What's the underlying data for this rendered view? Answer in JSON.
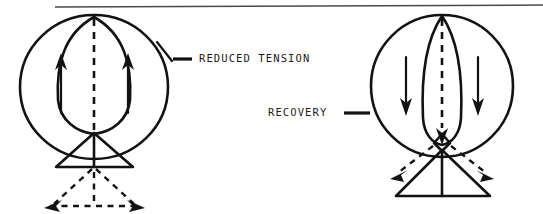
{
  "figure": {
    "title": "Reduced tension and recovery diagram",
    "background_color": "#ffffff",
    "ink_color": "#121212",
    "rule_color": "#4a4a4a",
    "top_rule": {
      "name": "page-top-rule",
      "x1": 55,
      "y1": 7,
      "x2": 543,
      "y2": 5
    },
    "labels": [
      {
        "id": "reduced-tension",
        "text": "REDUCED TENSION",
        "x": 196,
        "y": 59,
        "leader": {
          "x1": 171,
          "y1": 59,
          "x2": 191,
          "y2": 59
        },
        "pointer": {
          "x1": 158,
          "y1": 44,
          "x2": 172,
          "y2": 60
        }
      },
      {
        "id": "recovery",
        "text": "RECOVERY",
        "x": 268,
        "y": 113,
        "leader": {
          "x1": 344,
          "y1": 113,
          "x2": 366,
          "y2": 113
        }
      }
    ],
    "panels": [
      {
        "id": "panel-reduced-tension",
        "name": "reduced-tension-panel",
        "caption_ref": "reduced-tension",
        "balloon": {
          "cx": 94,
          "cy": 87,
          "rx": 74,
          "ry": 72
        },
        "inner_lens": {
          "cx": 94,
          "cy": 76,
          "rx": 36,
          "ry": 60,
          "shape": "wide-lens"
        },
        "center_dashed_line": {
          "x": 94,
          "y1": 18,
          "y2": 134
        },
        "flow_arrows": [
          {
            "id": "left-up-arrow",
            "x": 61,
            "y1": 112,
            "y2": 58,
            "direction": "up"
          },
          {
            "id": "right-up-arrow",
            "x": 128,
            "y1": 112,
            "y2": 58,
            "direction": "up"
          }
        ],
        "solid_triangle": {
          "apex_x": 94,
          "apex_y": 133,
          "left_x": 56,
          "right_x": 133,
          "base_y": 167
        },
        "triangle_center_post": {
          "x": 94,
          "y1": 133,
          "y2": 167
        },
        "dashed_triangle": {
          "apex_x": 94,
          "apex_y": 167,
          "left_x": 45,
          "right_x": 145,
          "base_y": 206,
          "arrowheads": [
            "bottom-left",
            "bottom-right"
          ]
        },
        "dashed_center_post": {
          "x": 94,
          "y1": 169,
          "y2": 206
        }
      },
      {
        "id": "panel-recovery",
        "name": "recovery-panel",
        "caption_ref": "recovery",
        "balloon": {
          "cx": 442,
          "cy": 86,
          "rx": 71,
          "ry": 71
        },
        "inner_lens": {
          "cx": 442,
          "cy": 80,
          "rx": 22,
          "ry": 65,
          "shape": "narrow-lens"
        },
        "center_dashed_line": {
          "x": 442,
          "y1": 18,
          "y2": 140
        },
        "flow_arrows": [
          {
            "id": "left-down-arrow",
            "x": 406,
            "y1": 57,
            "y2": 113,
            "direction": "down"
          },
          {
            "id": "right-down-arrow",
            "x": 478,
            "y1": 57,
            "y2": 113,
            "direction": "down"
          }
        ],
        "center_node": {
          "cx": 442,
          "cy": 142,
          "r": 7,
          "shape": "diamond"
        },
        "node_arrow": {
          "x": 442,
          "y1": 128,
          "y2": 143,
          "direction": "down"
        },
        "solid_triangle": {
          "apex_x": 442,
          "apex_y": 150,
          "left_x": 396,
          "right_x": 490,
          "base_y": 196
        },
        "triangle_center_post": {
          "x": 442,
          "y1": 150,
          "y2": 196
        },
        "dashed_recoil_arrows": [
          {
            "id": "left-recoil-arrow",
            "x1": 434,
            "y1": 146,
            "x2": 394,
            "y2": 178,
            "direction": "down-left"
          },
          {
            "id": "right-recoil-arrow",
            "x1": 450,
            "y1": 146,
            "x2": 490,
            "y2": 178,
            "direction": "down-right"
          }
        ]
      }
    ]
  }
}
